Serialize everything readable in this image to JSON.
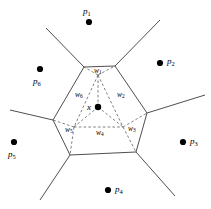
{
  "figure": {
    "background_color": "#ffffff",
    "stroke_color": "#3a3a3a",
    "dash_color": "#555555",
    "point_color": "#000000",
    "width": 211,
    "height": 209
  },
  "center": {
    "label": "x",
    "label_sub": "",
    "x": 98,
    "y": 107,
    "radius": 3.2,
    "label_x": 87,
    "label_y": 103
  },
  "sites": [
    {
      "name": "p1",
      "label": "p",
      "sub": "1",
      "x": 89,
      "y": 22,
      "label_x": 83,
      "label_y": 7
    },
    {
      "name": "p2",
      "label": "p",
      "sub": "2",
      "x": 160,
      "y": 63,
      "label_x": 167,
      "label_y": 57
    },
    {
      "name": "p3",
      "label": "p",
      "sub": "3",
      "x": 183,
      "y": 142,
      "label_x": 190,
      "label_y": 137
    },
    {
      "name": "p4",
      "label": "p",
      "sub": "4",
      "x": 108,
      "y": 190,
      "label_x": 115,
      "label_y": 185
    },
    {
      "name": "p5",
      "label": "p",
      "sub": "5",
      "x": 14,
      "y": 142,
      "label_x": 8,
      "label_y": 150
    },
    {
      "name": "p6",
      "label": "p",
      "sub": "6",
      "x": 40,
      "y": 69,
      "label_x": 33,
      "label_y": 77
    }
  ],
  "weights": [
    {
      "name": "w1",
      "label": "w",
      "sub": "1",
      "label_x": 94,
      "label_y": 67
    },
    {
      "name": "w2",
      "label": "w",
      "sub": "2",
      "label_x": 117,
      "label_y": 91
    },
    {
      "name": "w3",
      "label": "w",
      "sub": "3",
      "label_x": 128,
      "label_y": 125
    },
    {
      "name": "w4",
      "label": "w",
      "sub": "4",
      "label_x": 96,
      "label_y": 129
    },
    {
      "name": "w5",
      "label": "w",
      "sub": "5",
      "label_x": 65,
      "label_y": 126
    },
    {
      "name": "w6",
      "label": "w",
      "sub": "6",
      "label_x": 75,
      "label_y": 91
    }
  ],
  "geometry": {
    "central_cell_vertices": "84,67 115,66 147,113 136,152 70,155 53,120",
    "outer_edges": [
      "84,67 46,28",
      "115,66 160,20",
      "147,113 205,95",
      "136,152 175,196",
      "70,155 40,200",
      "53,120 10,110"
    ],
    "sub_cell_dashed_edges": [
      "98,107 98,75",
      "98,107 123,127",
      "98,107 74,127",
      "98,75 84,67",
      "98,75 115,66",
      "123,127 147,113",
      "123,127 136,152",
      "74,127 53,120",
      "74,127 70,155",
      "98,75 123,127",
      "98,75 74,127",
      "74,127 123,127"
    ]
  },
  "meta": {
    "description_w1": "sub-region w1 near top edge",
    "description_w2": "sub-region w2 on upper right",
    "description_w3": "sub-region w3 on lower right",
    "description_w4": "sub-region w4 at bottom",
    "description_w5": "sub-region w5 on lower left",
    "description_w6": "sub-region w6 on upper left"
  }
}
